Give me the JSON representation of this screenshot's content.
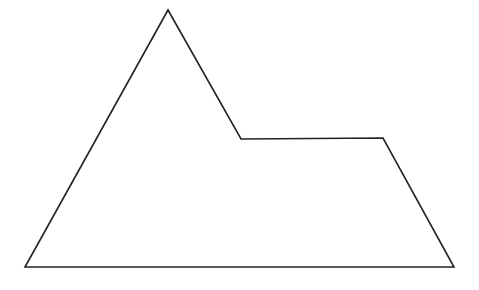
{
  "diagram": {
    "type": "polygon-outline",
    "vertex_count": 5,
    "stroke_color": "#222222",
    "fill_color": "#ffffff",
    "background_color": "#ffffff"
  }
}
